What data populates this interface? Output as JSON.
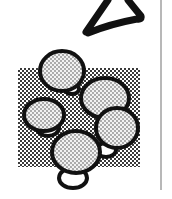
{
  "document": {
    "type": "scanned-illustration-fragment",
    "colors": {
      "ink": "#111111",
      "halftone_dark": "#3a3a3a",
      "halftone_light": "#ffffff",
      "bubble_dot": "#8a8a8a",
      "rule": "#b8b8b8",
      "paper": "#ffffff"
    },
    "elements": [
      {
        "name": "handwritten-stroke",
        "description": "partial hand-drawn triangular glyph (like a letter A) in thick black ink"
      },
      {
        "name": "halftone-square",
        "description": "checkered halftone background square"
      },
      {
        "name": "bubble-cluster",
        "description": "cluster of five dotted circles outlined in black, with small white lobes between them"
      },
      {
        "name": "margin-rule",
        "description": "thin vertical gray line at right edge"
      }
    ]
  }
}
